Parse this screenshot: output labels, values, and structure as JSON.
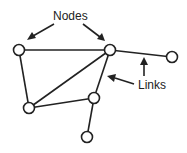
{
  "diagram": {
    "type": "network-graph",
    "labels": {
      "nodes": "Nodes",
      "links": "Links"
    },
    "nodes": [
      {
        "id": "n1",
        "x": 19,
        "y": 50
      },
      {
        "id": "n2",
        "x": 110,
        "y": 50
      },
      {
        "id": "n3",
        "x": 172,
        "y": 57
      },
      {
        "id": "n4",
        "x": 29,
        "y": 108
      },
      {
        "id": "n5",
        "x": 94,
        "y": 98
      },
      {
        "id": "n6",
        "x": 87,
        "y": 137
      }
    ],
    "links": [
      {
        "from": "n1",
        "to": "n2"
      },
      {
        "from": "n1",
        "to": "n4"
      },
      {
        "from": "n2",
        "to": "n4"
      },
      {
        "from": "n2",
        "to": "n5"
      },
      {
        "from": "n2",
        "to": "n3"
      },
      {
        "from": "n4",
        "to": "n5"
      },
      {
        "from": "n5",
        "to": "n6"
      }
    ],
    "colors": {
      "stroke": "#222222",
      "node_fill": "#ffffff",
      "background": "#ffffff"
    }
  }
}
